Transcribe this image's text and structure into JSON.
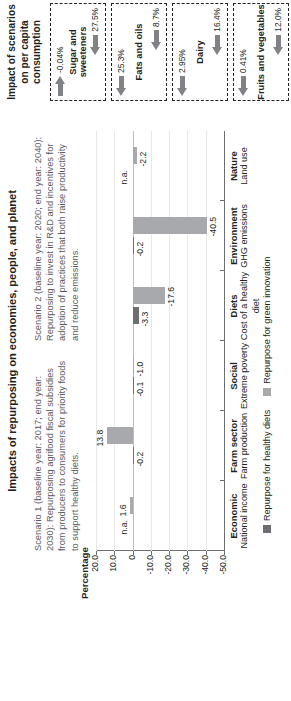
{
  "figure": {
    "title": "Impacts of repurposing on economies, people, and planet",
    "notes": [
      "Scenario 1 (baseline year: 2017; end year: 2030): Repurposing agrifood fiscal subsidies from producers to consumers for priority foods to support healthy diets.",
      "Scenario 2 (baseline year: 2020; end year: 2040): Repurposing to invest in R&D and incentives for adoption of practices that both raise productivity and reduce emissions."
    ]
  },
  "chart_data": {
    "type": "bar",
    "title": "Impacts of repurposing on economies, people, and planet",
    "ylabel": "Percentage",
    "xlabel": "",
    "ylim": [
      -50.0,
      20.0
    ],
    "yticks": [
      "20.0",
      "10.0",
      "0",
      "-10.0",
      "-20.0",
      "-30.0",
      "-40.0",
      "-50.0"
    ],
    "grid": true,
    "legend_position": "bottom",
    "categories": [
      {
        "group": "Economic",
        "label": "National income"
      },
      {
        "group": "Farm sector",
        "label": "Farm production"
      },
      {
        "group": "Social",
        "label": "Extreme poverty"
      },
      {
        "group": "Diets",
        "label": "Cost of a healthy diet"
      },
      {
        "group": "Environment",
        "label": "GHG emissions"
      },
      {
        "group": "Nature",
        "label": "Land use"
      }
    ],
    "series": [
      {
        "name": "Repurpose for healthy diets",
        "color": "#6d6e71",
        "values": [
          null,
          -0.2,
          -0.1,
          -3.3,
          -0.2,
          null
        ],
        "labels": [
          "n.a.",
          "-0.2",
          "-0.1",
          "-3.3",
          "-0.2",
          "n.a."
        ]
      },
      {
        "name": "Repurpose for green innovation",
        "color": "#a7a9ac",
        "values": [
          1.6,
          13.8,
          -1.0,
          -17.6,
          -40.5,
          -2.2
        ],
        "labels": [
          "1.6",
          "13.8",
          "-1.0",
          "-17.6",
          "-40.5",
          "-2.2"
        ]
      }
    ]
  },
  "panel": {
    "title": "Impact of scenarios on per capita consumption",
    "groups": [
      {
        "name": "Sugar and sweeteners",
        "scenario1": "-0.04%",
        "scenario1_dir": "right",
        "scenario2": "27.5%",
        "scenario2_dir": "left"
      },
      {
        "name": "Fats and oils",
        "scenario1": "25.3%",
        "scenario1_dir": "left",
        "scenario2": "8.7%",
        "scenario2_dir": "left"
      },
      {
        "name": "Dairy",
        "scenario1": "2.95%",
        "scenario1_dir": "left",
        "scenario2": "16.4%",
        "scenario2_dir": "left"
      },
      {
        "name": "Fruits and vegetables",
        "scenario1": "0.41%",
        "scenario1_dir": "left",
        "scenario2": "12.0%",
        "scenario2_dir": "left"
      }
    ]
  }
}
